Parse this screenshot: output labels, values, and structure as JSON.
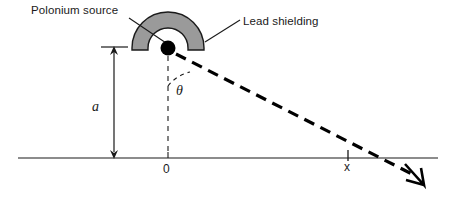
{
  "figure": {
    "labels": {
      "polonium_source": "Polonium source",
      "lead_shielding": "Lead shielding",
      "height": "a",
      "angle": "θ",
      "origin": "0",
      "landing_point": "x"
    },
    "colors": {
      "shielding_fill": "#9a9a9a",
      "shielding_stroke": "#1a1a1a",
      "source_dot": "#000000",
      "baseline": "#1a1a1a",
      "trajectory": "#000000",
      "background": "#ffffff"
    },
    "geometry": {
      "source_x": 168,
      "source_y": 48,
      "baseline_y": 158,
      "baseline_start_x": 18,
      "baseline_end_x": 438,
      "landing_x": 348,
      "shielding_outer_radius": 36,
      "shielding_inner_radius": 20,
      "height_a_top_y": 47,
      "height_a_x": 114
    }
  }
}
